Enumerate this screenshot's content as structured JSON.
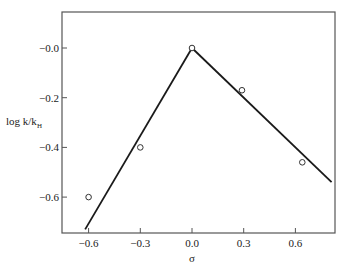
{
  "chart_data": {
    "type": "scatter",
    "title": "",
    "xlabel": "σ",
    "ylabel": "log k/kH",
    "ylabel_main": "log k/k",
    "ylabel_sub": "H",
    "xlim": [
      -0.67,
      0.85
    ],
    "ylim": [
      -0.74,
      0.14
    ],
    "x_ticks": [
      -0.6,
      -0.3,
      0.0,
      0.3,
      0.6
    ],
    "x_tick_labels": [
      "-0.6",
      "-0.3",
      "0.0",
      "0.3",
      "0.6"
    ],
    "y_ticks": [
      0.0,
      -0.2,
      -0.4,
      -0.6
    ],
    "y_tick_labels": [
      "-0.0",
      "-0.2",
      "-0.4",
      "-0.6"
    ],
    "grid": false,
    "legend": null,
    "series": [
      {
        "name": "observed",
        "marker": "open-circle",
        "x": [
          -0.6,
          -0.3,
          0.0,
          0.29,
          0.64
        ],
        "y": [
          -0.6,
          -0.4,
          0.0,
          -0.17,
          -0.46
        ]
      },
      {
        "name": "fit-left",
        "style": "line",
        "x": [
          -0.62,
          0.0
        ],
        "y": [
          -0.73,
          0.0
        ]
      },
      {
        "name": "fit-right",
        "style": "line",
        "x": [
          0.0,
          0.81
        ],
        "y": [
          0.0,
          -0.54
        ]
      }
    ]
  },
  "colors": {
    "axis": "#555555",
    "line": "#1a1a1a",
    "marker": "#333333"
  }
}
